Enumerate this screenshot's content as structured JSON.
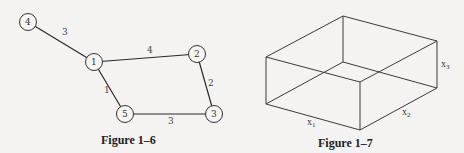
{
  "figures": [
    {
      "caption": "Figure 1–6",
      "type": "weighted-graph",
      "nodes": [
        {
          "id": "1",
          "label": "1",
          "x": 94,
          "y": 62
        },
        {
          "id": "2",
          "label": "2",
          "x": 197,
          "y": 54
        },
        {
          "id": "3",
          "label": "3",
          "x": 214,
          "y": 114
        },
        {
          "id": "4",
          "label": "4",
          "x": 28,
          "y": 22
        },
        {
          "id": "5",
          "label": "5",
          "x": 125,
          "y": 114
        }
      ],
      "edges": [
        {
          "from": "4",
          "to": "1",
          "weight": "3"
        },
        {
          "from": "1",
          "to": "2",
          "weight": "4"
        },
        {
          "from": "2",
          "to": "3",
          "weight": "2"
        },
        {
          "from": "1",
          "to": "5",
          "weight": "1"
        },
        {
          "from": "5",
          "to": "3",
          "weight": "3"
        }
      ]
    },
    {
      "caption": "Figure 1–7",
      "type": "rectangular-box",
      "labels": {
        "x1": {
          "base": "x",
          "sub": "1"
        },
        "x2": {
          "base": "x",
          "sub": "2"
        },
        "x3": {
          "base": "x",
          "sub": "3"
        }
      }
    }
  ]
}
